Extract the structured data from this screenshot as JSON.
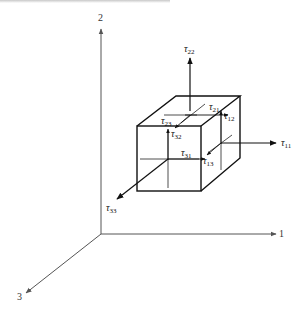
{
  "header": {
    "text_clipped": true
  },
  "axes": {
    "axis1": {
      "label": "1"
    },
    "axis2": {
      "label": "2"
    },
    "axis3": {
      "label": "3"
    }
  },
  "stresses": {
    "t11": {
      "symbol": "τ",
      "sub": "11"
    },
    "t22": {
      "symbol": "τ",
      "sub": "22"
    },
    "t33": {
      "symbol": "τ",
      "sub": "33"
    },
    "t21": {
      "symbol": "τ",
      "sub": "21"
    },
    "t12": {
      "symbol": "τ",
      "sub": "12"
    },
    "t23": {
      "symbol": "τ",
      "sub": "23"
    },
    "t32": {
      "symbol": "τ",
      "sub": "32"
    },
    "t31": {
      "symbol": "τ",
      "sub": "31"
    },
    "t13": {
      "symbol": "τ",
      "sub": "13"
    }
  },
  "colors": {
    "line": "#111111",
    "axis": "#555555",
    "background": "#ffffff"
  }
}
